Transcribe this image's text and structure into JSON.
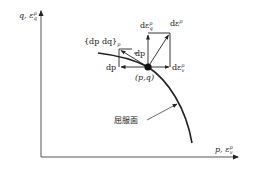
{
  "figure": {
    "type": "yield-surface-flow-rule-diagram",
    "axes": {
      "y_axis_label": "q, ε",
      "y_axis_label_sub": "q",
      "y_axis_label_sup": "p",
      "x_axis_label": "p, ε",
      "x_axis_label_sub": "v",
      "x_axis_label_sup": "p"
    },
    "labels": {
      "stress_increment": "{dp  dq}",
      "stress_increment_sub": "p",
      "dp_upper": "dp",
      "dp_lower": "dp",
      "point": "(p,q)",
      "d_eps_q": "dε",
      "d_eps_q_sub": "q",
      "d_eps_q_sup": "p",
      "d_eps": "dε",
      "d_eps_sup": "p",
      "d_eps_v": "dε",
      "d_eps_v_sub": "v",
      "d_eps_v_sup": "p",
      "yield_surface": "屈服面"
    },
    "colors": {
      "line": "#222222",
      "axis": "#555555",
      "background": "#ffffff"
    }
  }
}
